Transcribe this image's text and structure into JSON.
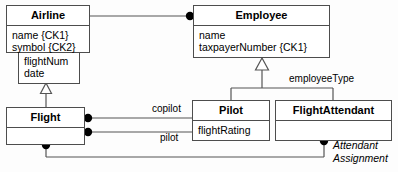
{
  "diagram": {
    "type": "uml-class-diagram",
    "colors": {
      "box_border": "#4d4d4d",
      "box_fill": "#ffffff",
      "line": "#555555",
      "text": "#000000",
      "background": "#fdfdfd"
    }
  },
  "classes": [
    {
      "id": "airline",
      "name": "Airline",
      "attributes": [
        "name {CK1}",
        "symbol {CK2}"
      ],
      "x": 6,
      "y": 5,
      "width": 84,
      "height": 48
    },
    {
      "id": "flight-super",
      "name": "",
      "attributes": [
        "flightNum",
        "date"
      ],
      "x": 18,
      "y": 50,
      "width": 62,
      "height": 34
    },
    {
      "id": "employee",
      "name": "Employee",
      "attributes": [
        "name",
        "taxpayerNumber {CK1}"
      ],
      "x": 193,
      "y": 5,
      "width": 137,
      "height": 53
    },
    {
      "id": "flight",
      "name": "Flight",
      "attributes": [],
      "x": 6,
      "y": 107,
      "width": 79,
      "height": 38
    },
    {
      "id": "pilot",
      "name": "Pilot",
      "attributes": [
        "flightRating"
      ],
      "x": 192,
      "y": 100,
      "width": 78,
      "height": 41
    },
    {
      "id": "flightattendant",
      "name": "FlightAttendant",
      "attributes": [],
      "x": 275,
      "y": 100,
      "width": 117,
      "height": 41
    }
  ],
  "edge_labels": [
    {
      "id": "employee-type",
      "text": "employeeType",
      "x": 289,
      "y": 75,
      "italic": false
    },
    {
      "id": "copilot",
      "text": "copilot",
      "x": 152,
      "y": 104,
      "italic": false
    },
    {
      "id": "pilot-role",
      "text": "pilot",
      "x": 160,
      "y": 133,
      "italic": false
    },
    {
      "id": "attendant-assignment-line1",
      "text": "Attendant",
      "x": 333,
      "y": 142,
      "italic": true
    },
    {
      "id": "attendant-assignment-line2",
      "text": "Assignment",
      "x": 333,
      "y": 154,
      "italic": true
    }
  ],
  "relationships": [
    {
      "id": "airline-employee",
      "kind": "association",
      "from": "airline",
      "to": "employee",
      "end_marker": "filled-dot"
    },
    {
      "id": "flight-generalization",
      "kind": "generalization",
      "from": "flight",
      "to": "flight-super",
      "end_marker": "hollow-triangle"
    },
    {
      "id": "employee-generalization",
      "kind": "generalization",
      "from": [
        "pilot",
        "flightattendant"
      ],
      "to": "employee",
      "end_marker": "hollow-triangle",
      "label": "employeeType"
    },
    {
      "id": "flight-copilot",
      "kind": "association",
      "from": "flight",
      "to": "pilot",
      "label": "copilot",
      "end_marker": "filled-dot"
    },
    {
      "id": "flight-pilot",
      "kind": "association",
      "from": "flight",
      "to": "pilot",
      "label": "pilot",
      "end_marker": "filled-dot"
    },
    {
      "id": "flight-attendant-assignment",
      "kind": "association",
      "from": "flight",
      "to": "flightattendant",
      "label": "Attendant Assignment",
      "end_marker": "filled-dot"
    }
  ]
}
